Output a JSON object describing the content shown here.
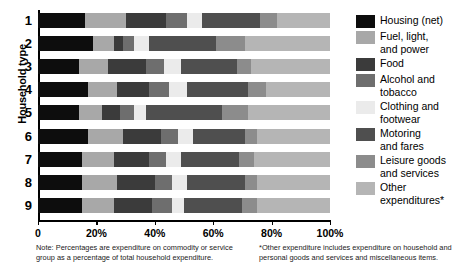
{
  "chart_data": {
    "type": "bar",
    "orientation": "horizontal",
    "stacked": true,
    "title": "",
    "xlabel": "",
    "ylabel": "Household type",
    "xlim": [
      0,
      100
    ],
    "xticks": [
      0,
      20,
      40,
      60,
      80,
      100
    ],
    "xticklabels": [
      "0",
      "20%",
      "40%",
      "60%",
      "80%",
      "100%"
    ],
    "grid": false,
    "legend_position": "right",
    "categories": [
      "1",
      "2",
      "3",
      "4",
      "5",
      "6",
      "7",
      "8",
      "9"
    ],
    "series": [
      {
        "name": "Housing (net)",
        "color": "#0d0d0d",
        "values": [
          16,
          19,
          14,
          17,
          14,
          17,
          15,
          15,
          15
        ]
      },
      {
        "name": "Fuel, light, and power",
        "color": "#a8a8a8",
        "values": [
          14,
          7,
          10,
          10,
          8,
          12,
          11,
          12,
          11
        ]
      },
      {
        "name": "Food",
        "color": "#3b3b3b",
        "values": [
          14,
          3,
          13,
          11,
          6,
          13,
          12,
          13,
          13
        ]
      },
      {
        "name": "Alcohol and tobacco",
        "color": "#6e6e6e",
        "values": [
          7,
          4,
          6,
          7,
          5,
          6,
          6,
          6,
          7
        ]
      },
      {
        "name": "Clothing and footwear",
        "color": "#ebebeb",
        "values": [
          5,
          5,
          6,
          6,
          4,
          5,
          5,
          5,
          4
        ]
      },
      {
        "name": "Motoring and fares",
        "color": "#4f4f4f",
        "values": [
          20,
          23,
          19,
          21,
          26,
          18,
          20,
          20,
          20
        ]
      },
      {
        "name": "Leisure goods and services",
        "color": "#8c8c8c",
        "values": [
          6,
          10,
          5,
          6,
          9,
          4,
          5,
          4,
          5
        ]
      },
      {
        "name": "Other expenditures*",
        "color": "#b5b5b5",
        "values": [
          18,
          29,
          27,
          22,
          28,
          25,
          26,
          25,
          25
        ]
      }
    ]
  },
  "axis": {
    "ylabel": "Household type",
    "ticklabels": [
      "0",
      "20%",
      "40%",
      "60%",
      "80%",
      "100%"
    ]
  },
  "legend": {
    "items": [
      {
        "label": "Housing (net)",
        "color": "#0d0d0d"
      },
      {
        "label": "Fuel, light,\nand power",
        "color": "#a8a8a8"
      },
      {
        "label": "Food",
        "color": "#3b3b3b"
      },
      {
        "label": "Alcohol and\ntobacco",
        "color": "#6e6e6e"
      },
      {
        "label": "Clothing and\nfootwear",
        "color": "#ebebeb"
      },
      {
        "label": "Motoring\nand fares",
        "color": "#4f4f4f"
      },
      {
        "label": "Leisure goods\nand services",
        "color": "#8c8c8c"
      },
      {
        "label": "Other\nexpenditures*",
        "color": "#b5b5b5"
      }
    ]
  },
  "notes": {
    "left": "Note: Percentages are expenditure on commodity or service group as a percentage of total household expenditure.",
    "right": "*Other expenditure includes expenditure on household and personal goods and services and miscellaneous items."
  }
}
